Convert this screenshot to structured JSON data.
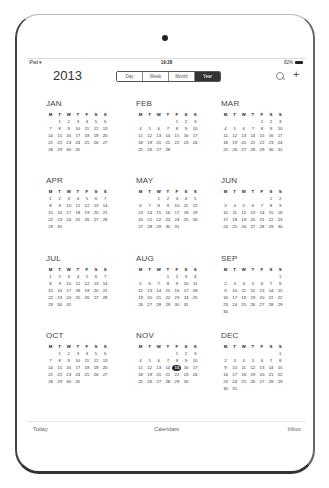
{
  "status_bar": {
    "device": "iPad",
    "wifi_icon": "▾",
    "time": "19:28",
    "battery_percent": "82%"
  },
  "header": {
    "year": "2013",
    "segments": [
      {
        "label": "Day",
        "active": false
      },
      {
        "label": "Week",
        "active": false
      },
      {
        "label": "Month",
        "active": false
      },
      {
        "label": "Year",
        "active": true
      }
    ],
    "search_icon": "search-icon",
    "add_icon": "+"
  },
  "weekday_headers": [
    "M",
    "T",
    "W",
    "T",
    "F",
    "S",
    "S"
  ],
  "today": {
    "month": 11,
    "day": 15
  },
  "months": [
    {
      "name": "JAN",
      "offset": 1,
      "days": 31
    },
    {
      "name": "FEB",
      "offset": 4,
      "days": 28
    },
    {
      "name": "MAR",
      "offset": 4,
      "days": 31
    },
    {
      "name": "APR",
      "offset": 0,
      "days": 30
    },
    {
      "name": "MAY",
      "offset": 2,
      "days": 31
    },
    {
      "name": "JUN",
      "offset": 5,
      "days": 30
    },
    {
      "name": "JUL",
      "offset": 0,
      "days": 31
    },
    {
      "name": "AUG",
      "offset": 3,
      "days": 31
    },
    {
      "name": "SEP",
      "offset": 6,
      "days": 30
    },
    {
      "name": "OCT",
      "offset": 1,
      "days": 31
    },
    {
      "name": "NOV",
      "offset": 4,
      "days": 30
    },
    {
      "name": "DEC",
      "offset": 6,
      "days": 31
    }
  ],
  "tabbar": {
    "today": "Today",
    "calendars": "Calendars",
    "inbox": "Inbox"
  }
}
